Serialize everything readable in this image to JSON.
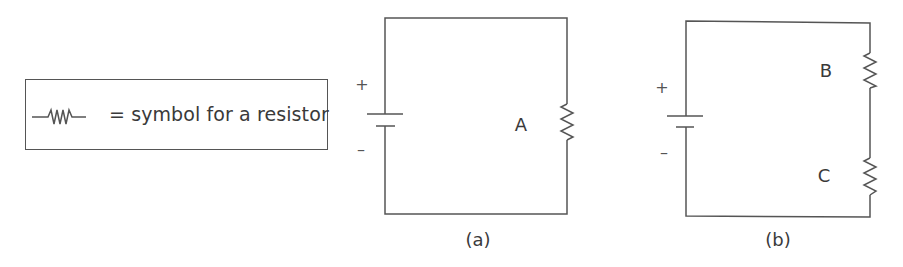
{
  "legend": {
    "symbol_icon": "resistor-zigzag-icon",
    "text": "= symbol for a resistor"
  },
  "circuits": [
    {
      "id": "a",
      "caption": "(a)",
      "battery": {
        "positive": "+",
        "negative": "–"
      },
      "resistors": [
        {
          "label": "A"
        }
      ]
    },
    {
      "id": "b",
      "caption": "(b)",
      "battery": {
        "positive": "+",
        "negative": "–"
      },
      "resistors": [
        {
          "label": "B"
        },
        {
          "label": "C"
        }
      ]
    }
  ],
  "colors": {
    "line": "#555555",
    "text": "#3a3a3a",
    "background": "#ffffff"
  }
}
